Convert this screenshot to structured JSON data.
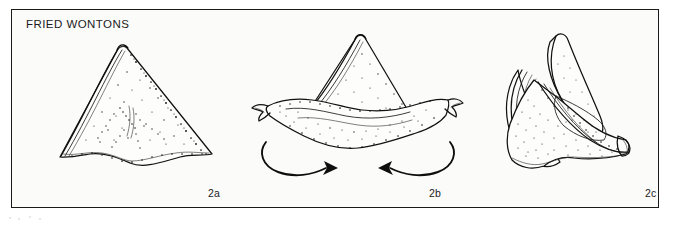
{
  "figure": {
    "title": "FRIED WONTONS",
    "frame_color": "#1a1a1a",
    "background_color": "#fbfbfa",
    "ink_color": "#111111",
    "media": "black-and-white line drawing with stipple shading"
  },
  "steps": [
    {
      "label": "2a",
      "name": "triangle-fold",
      "caption_text": "2a",
      "description": "Filled wonton wrapper folded into a triangle, front view, stippled fried surface"
    },
    {
      "label": "2b",
      "name": "wings-spread",
      "caption_text": "2b",
      "description": "Triangle with the two lower corners drawn out into wide pointed wings; curved arrows show the wings folding toward each other"
    },
    {
      "label": "2c",
      "name": "wings-joined",
      "caption_text": "2c",
      "description": "Finished wonton with the wings brought around and pinched together, three-quarter view"
    }
  ],
  "annotations": {
    "arrow_left": {
      "name": "fold-arrow-left",
      "direction": "clockwise-to-right",
      "meaning": "bring left wing forward and around"
    },
    "arrow_right": {
      "name": "fold-arrow-right",
      "direction": "counterclockwise-to-left",
      "meaning": "bring right wing forward and around"
    }
  }
}
